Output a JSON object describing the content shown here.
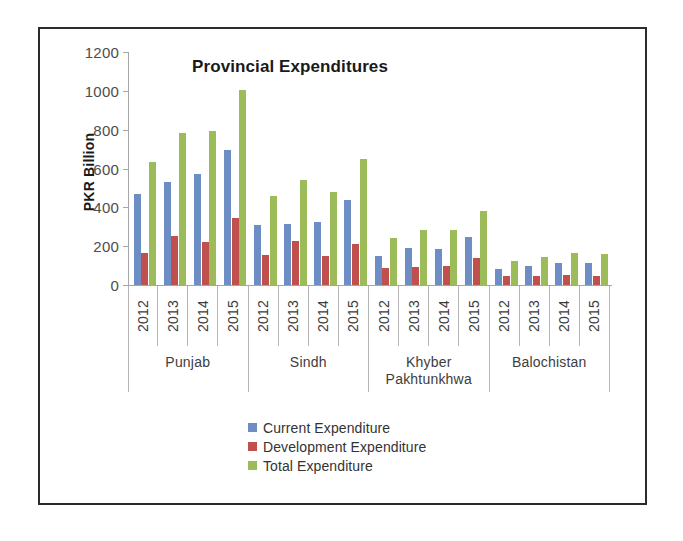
{
  "chart_data": {
    "type": "bar",
    "title": "Provincial Expenditures",
    "xlabel": "",
    "ylabel": "PKR Billion",
    "ylim": [
      0,
      1200
    ],
    "yticks": [
      0,
      200,
      400,
      600,
      800,
      1000,
      1200
    ],
    "grid": false,
    "legend_position": "bottom",
    "groups": [
      "Punjab",
      "Sindh",
      "Khyber Pakhtunkhwa",
      "Balochistan"
    ],
    "categories": [
      "2012",
      "2013",
      "2014",
      "2015",
      "2012",
      "2013",
      "2014",
      "2015",
      "2012",
      "2013",
      "2014",
      "2015",
      "2012",
      "2013",
      "2014",
      "2015"
    ],
    "series": [
      {
        "name": "Current Expenditure",
        "color": "#6c8ec4",
        "values": [
          468,
          532,
          573,
          695,
          308,
          315,
          325,
          437,
          152,
          190,
          183,
          245,
          80,
          100,
          113,
          115
        ]
      },
      {
        "name": "Development Expenditure",
        "color": "#c0504d",
        "values": [
          165,
          250,
          220,
          343,
          155,
          228,
          150,
          213,
          90,
          95,
          100,
          137,
          45,
          45,
          50,
          47
        ]
      },
      {
        "name": "Total Expenditure",
        "color": "#9cbb59",
        "values": [
          633,
          782,
          793,
          1005,
          460,
          543,
          478,
          648,
          242,
          285,
          283,
          382,
          125,
          145,
          163,
          162
        ]
      }
    ],
    "groups_detail": [
      {
        "province": "Punjab",
        "years": [
          {
            "year": "2012",
            "current": 468,
            "development": 165,
            "total": 633
          },
          {
            "year": "2013",
            "current": 532,
            "development": 250,
            "total": 782
          },
          {
            "year": "2014",
            "current": 573,
            "development": 220,
            "total": 793
          },
          {
            "year": "2015",
            "current": 695,
            "development": 343,
            "total": 1005
          }
        ]
      },
      {
        "province": "Sindh",
        "years": [
          {
            "year": "2012",
            "current": 308,
            "development": 155,
            "total": 460
          },
          {
            "year": "2013",
            "current": 315,
            "development": 228,
            "total": 543
          },
          {
            "year": "2014",
            "current": 325,
            "development": 150,
            "total": 478
          },
          {
            "year": "2015",
            "current": 437,
            "development": 213,
            "total": 648
          }
        ]
      },
      {
        "province": "Khyber Pakhtunkhwa",
        "years": [
          {
            "year": "2012",
            "current": 152,
            "development": 90,
            "total": 242
          },
          {
            "year": "2013",
            "current": 190,
            "development": 95,
            "total": 285
          },
          {
            "year": "2014",
            "current": 183,
            "development": 100,
            "total": 283
          },
          {
            "year": "2015",
            "current": 245,
            "development": 137,
            "total": 382
          }
        ]
      },
      {
        "province": "Balochistan",
        "years": [
          {
            "year": "2012",
            "current": 80,
            "development": 45,
            "total": 125
          },
          {
            "year": "2013",
            "current": 100,
            "development": 45,
            "total": 145
          },
          {
            "year": "2014",
            "current": 113,
            "development": 50,
            "total": 163
          },
          {
            "year": "2015",
            "current": 115,
            "development": 47,
            "total": 162
          }
        ]
      }
    ]
  },
  "axis": {
    "y_title": "PKR Billion",
    "ticks": [
      "1200",
      "1000",
      "800",
      "600",
      "400",
      "200",
      "0"
    ]
  },
  "legend": [
    {
      "label": "Current Expenditure",
      "color": "#6c8ec4"
    },
    {
      "label": "Development Expenditure",
      "color": "#c0504d"
    },
    {
      "label": "Total Expenditure",
      "color": "#9cbb59"
    }
  ],
  "colors": {
    "current": "#6c8ec4",
    "development": "#c0504d",
    "total": "#9cbb59",
    "axis": "#a6a6a6",
    "text": "#3d3d3d",
    "frame": "#2b2b2b"
  }
}
